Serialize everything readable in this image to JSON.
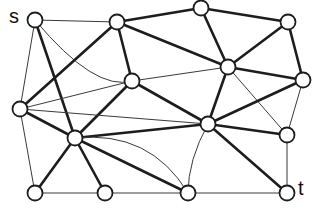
{
  "figure": {
    "type": "undirected-graph-diagram",
    "background_color": "#ffffff",
    "width": 315,
    "height": 212,
    "node_fill": "#ffffff",
    "node_stroke": "#1d1d1d",
    "edge_thick_color": "#1d1d1d",
    "edge_thin_color": "#3a3a3a",
    "node_radius": 7.5
  },
  "labels": {
    "source": "s",
    "sink": "t"
  },
  "graph_data": {
    "node_count": 16,
    "edge_count": 35,
    "nodes": [
      {
        "id": "s",
        "label": "s",
        "x": 35,
        "y": 20
      },
      {
        "id": "n1",
        "label": "",
        "x": 117,
        "y": 22
      },
      {
        "id": "n2",
        "label": "",
        "x": 201,
        "y": 8
      },
      {
        "id": "n3",
        "label": "",
        "x": 288,
        "y": 22
      },
      {
        "id": "n4",
        "label": "",
        "x": 132,
        "y": 81
      },
      {
        "id": "n5",
        "label": "",
        "x": 228,
        "y": 67
      },
      {
        "id": "n6",
        "label": "",
        "x": 303,
        "y": 80
      },
      {
        "id": "n7",
        "label": "",
        "x": 20,
        "y": 109
      },
      {
        "id": "n8",
        "label": "",
        "x": 208,
        "y": 124
      },
      {
        "id": "n9",
        "label": "",
        "x": 287,
        "y": 135
      },
      {
        "id": "n10",
        "label": "",
        "x": 75,
        "y": 138
      },
      {
        "id": "n11",
        "label": "",
        "x": 35,
        "y": 193
      },
      {
        "id": "n12",
        "label": "",
        "x": 105,
        "y": 193
      },
      {
        "id": "n13",
        "label": "",
        "x": 188,
        "y": 193
      },
      {
        "id": "t",
        "label": "t",
        "x": 287,
        "y": 193
      }
    ],
    "edges": [
      {
        "from": "s",
        "to": "n1",
        "style": "thin",
        "kind": "straight"
      },
      {
        "from": "s",
        "to": "n7",
        "style": "thin",
        "kind": "straight"
      },
      {
        "from": "s",
        "to": "n10",
        "style": "thick",
        "kind": "straight"
      },
      {
        "from": "s",
        "to": "n4",
        "style": "thin",
        "kind": "curve",
        "cx": 95,
        "cy": 92
      },
      {
        "from": "n1",
        "to": "n2",
        "style": "thick",
        "kind": "straight"
      },
      {
        "from": "n1",
        "to": "n4",
        "style": "thick",
        "kind": "straight"
      },
      {
        "from": "n1",
        "to": "n5",
        "style": "thick",
        "kind": "straight"
      },
      {
        "from": "n1",
        "to": "n7",
        "style": "thick",
        "kind": "straight"
      },
      {
        "from": "n2",
        "to": "n3",
        "style": "thick",
        "kind": "straight"
      },
      {
        "from": "n2",
        "to": "n5",
        "style": "thick",
        "kind": "straight"
      },
      {
        "from": "n3",
        "to": "n5",
        "style": "thick",
        "kind": "straight"
      },
      {
        "from": "n3",
        "to": "n6",
        "style": "thick",
        "kind": "straight"
      },
      {
        "from": "n4",
        "to": "n5",
        "style": "thin",
        "kind": "straight"
      },
      {
        "from": "n4",
        "to": "n7",
        "style": "thin",
        "kind": "straight"
      },
      {
        "from": "n4",
        "to": "n8",
        "style": "thick",
        "kind": "straight"
      },
      {
        "from": "n4",
        "to": "n10",
        "style": "thick",
        "kind": "straight"
      },
      {
        "from": "n5",
        "to": "n6",
        "style": "thick",
        "kind": "straight"
      },
      {
        "from": "n5",
        "to": "n8",
        "style": "thick",
        "kind": "straight"
      },
      {
        "from": "n5",
        "to": "n9",
        "style": "thin",
        "kind": "straight"
      },
      {
        "from": "n6",
        "to": "n8",
        "style": "thick",
        "kind": "straight"
      },
      {
        "from": "n6",
        "to": "n9",
        "style": "thin",
        "kind": "straight"
      },
      {
        "from": "n7",
        "to": "n10",
        "style": "thick",
        "kind": "straight"
      },
      {
        "from": "n7",
        "to": "n11",
        "style": "thin",
        "kind": "straight"
      },
      {
        "from": "n7",
        "to": "n8",
        "style": "thin",
        "kind": "straight"
      },
      {
        "from": "n8",
        "to": "n9",
        "style": "thick",
        "kind": "straight"
      },
      {
        "from": "n8",
        "to": "n10",
        "style": "thick",
        "kind": "straight"
      },
      {
        "from": "n8",
        "to": "n13",
        "style": "thin",
        "kind": "curve",
        "cx": 188,
        "cy": 160
      },
      {
        "from": "n8",
        "to": "t",
        "style": "thick",
        "kind": "straight"
      },
      {
        "from": "n9",
        "to": "t",
        "style": "thin",
        "kind": "straight"
      },
      {
        "from": "n10",
        "to": "n11",
        "style": "thick",
        "kind": "straight"
      },
      {
        "from": "n10",
        "to": "n12",
        "style": "thick",
        "kind": "straight"
      },
      {
        "from": "n10",
        "to": "n13",
        "style": "thick",
        "kind": "straight"
      },
      {
        "from": "n10",
        "to": "n13",
        "style": "thin",
        "kind": "curve",
        "cx": 150,
        "cy": 130
      },
      {
        "from": "n11",
        "to": "n12",
        "style": "thin",
        "kind": "straight"
      },
      {
        "from": "n12",
        "to": "n13",
        "style": "thin",
        "kind": "straight"
      },
      {
        "from": "n13",
        "to": "t",
        "style": "thin",
        "kind": "straight"
      }
    ]
  }
}
